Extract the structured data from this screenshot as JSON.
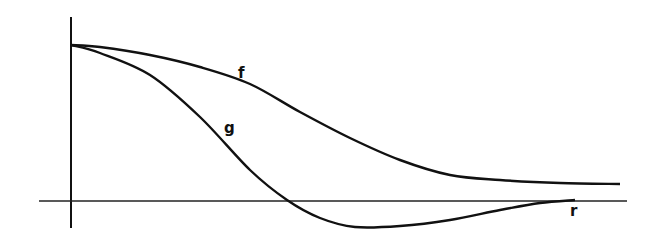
{
  "chart_data": {
    "type": "line",
    "title": "",
    "xlabel": "r",
    "ylabel": "",
    "grid": false,
    "legend": "none (curves labeled inline)",
    "series": [
      {
        "name": "f",
        "label": "f",
        "description": "Monotonically decaying curve from a maximum at r=0 toward a small positive asymptote",
        "points_px": [
          [
            71,
            45
          ],
          [
            100,
            47
          ],
          [
            150,
            55
          ],
          [
            200,
            67
          ],
          [
            250,
            84
          ],
          [
            300,
            112
          ],
          [
            350,
            138
          ],
          [
            400,
            160
          ],
          [
            450,
            175
          ],
          [
            500,
            180
          ],
          [
            560,
            183
          ],
          [
            620,
            184
          ]
        ]
      },
      {
        "name": "g",
        "label": "g",
        "description": "Decays from the same maximum, crosses zero, reaches a negative minimum, then approaches zero from below",
        "points_px": [
          [
            71,
            45
          ],
          [
            100,
            53
          ],
          [
            150,
            75
          ],
          [
            200,
            117
          ],
          [
            250,
            170
          ],
          [
            287,
            200
          ],
          [
            320,
            218
          ],
          [
            355,
            227
          ],
          [
            400,
            226
          ],
          [
            450,
            220
          ],
          [
            500,
            210
          ],
          [
            540,
            203
          ],
          [
            575,
            200
          ]
        ]
      }
    ],
    "axes_px": {
      "y_axis": {
        "x": 71,
        "y_top": 17,
        "y_bottom": 228
      },
      "x_axis": {
        "y": 201,
        "x_left": 39,
        "x_right": 627
      }
    },
    "labels": {
      "f": "f",
      "g": "g",
      "r": "r"
    }
  }
}
